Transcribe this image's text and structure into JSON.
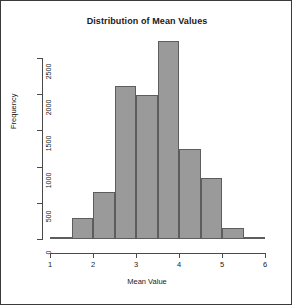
{
  "chart": {
    "title": "Distribution of Mean Values",
    "xlabel": "Mean Value",
    "ylabel": "Frequency"
  },
  "chart_data": {
    "type": "bar",
    "title": "Distribution of Mean Values",
    "subtitle": "",
    "xlabel": "Mean Value",
    "ylabel": "Frequency",
    "grid": false,
    "legend": null,
    "legend_position": "none",
    "xlim": [
      1,
      6
    ],
    "ylim": [
      0,
      2800
    ],
    "xticks": [
      1,
      2,
      3,
      4,
      5,
      6
    ],
    "xtick_labels": [
      "1",
      "2",
      "3",
      "4",
      "5",
      "6"
    ],
    "yticks": [
      0,
      500,
      1000,
      1500,
      2000,
      2500
    ],
    "ytick_labels": [
      "0",
      "500",
      "1000",
      "1500",
      "2000",
      "2500"
    ],
    "bin_width": 0.5,
    "bin_edges": [
      1.0,
      1.5,
      2.0,
      2.5,
      3.0,
      3.5,
      4.0,
      4.5,
      5.0,
      5.5,
      6.0
    ],
    "categories": [
      "1.0-1.5",
      "1.5-2.0",
      "2.0-2.5",
      "2.5-3.0",
      "3.0-3.5",
      "3.5-4.0",
      "4.0-4.5",
      "4.5-5.0",
      "5.0-5.5",
      "5.5-6.0"
    ],
    "values": [
      30,
      290,
      650,
      2110,
      1990,
      2730,
      1250,
      840,
      150,
      30
    ],
    "bar_fill_color": "#9a9a9a",
    "bar_border_color": "#5d5d5d",
    "axis_color": "#4a4a4a",
    "background_color": "#ffffff"
  }
}
